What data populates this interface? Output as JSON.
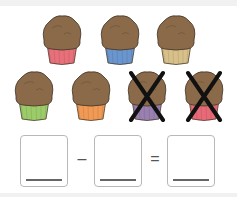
{
  "colors": {
    "muffin_top": "#8b6a4a",
    "muffin_outline": "#4a3a2a",
    "cross": "#111111",
    "box_border": "#b8b8b8",
    "answer_line": "#666666"
  },
  "muffins": [
    {
      "row": 1,
      "liner": "#e8707a",
      "crossed": false,
      "x": 40,
      "y": 14
    },
    {
      "row": 1,
      "liner": "#6a96cf",
      "crossed": false,
      "x": 98,
      "y": 14
    },
    {
      "row": 1,
      "liner": "#d8c08a",
      "crossed": false,
      "x": 154,
      "y": 14
    },
    {
      "row": 2,
      "liner": "#9ccc6a",
      "crossed": false,
      "x": 12,
      "y": 70
    },
    {
      "row": 2,
      "liner": "#f09a55",
      "crossed": false,
      "x": 69,
      "y": 70
    },
    {
      "row": 2,
      "liner": "#9a80b0",
      "crossed": true,
      "x": 125,
      "y": 70
    },
    {
      "row": 2,
      "liner": "#e86a78",
      "crossed": true,
      "x": 182,
      "y": 70
    }
  ],
  "equation": {
    "box1": "",
    "operator": "–",
    "box2": "",
    "equals": "=",
    "box3": ""
  }
}
